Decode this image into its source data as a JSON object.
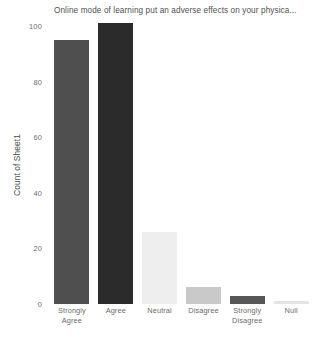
{
  "chart_data": {
    "type": "bar",
    "title": "Online mode of learning put an adverse effects on your physica...",
    "xlabel": "",
    "ylabel": "Count of Sheet1",
    "categories": [
      "Strongly Agree",
      "Agree",
      "Neutral",
      "Disagree",
      "Strongly Disagree",
      "Null"
    ],
    "values": [
      95,
      101,
      26,
      6,
      3,
      1
    ],
    "ylim": [
      0,
      100
    ],
    "yticks": [
      0,
      20,
      40,
      60,
      80,
      100
    ],
    "ytick_labels": [
      "0",
      "20",
      "40",
      "60",
      "80",
      "100"
    ],
    "grid": false,
    "legend": "none",
    "bar_colors": [
      "#4f4f4f",
      "#2b2b2b",
      "#eeeeee",
      "#c9c9c9",
      "#575757",
      "#e4e4e4"
    ],
    "background": "#ffffff"
  },
  "axis": {
    "y_title": "Count of Sheet1"
  },
  "categories_wrapped": [
    [
      "Strongly",
      "Agree"
    ],
    [
      "Agree"
    ],
    [
      "Neutral"
    ],
    [
      "Disagree"
    ],
    [
      "Strongly",
      "Disagree"
    ],
    [
      "Null"
    ]
  ]
}
